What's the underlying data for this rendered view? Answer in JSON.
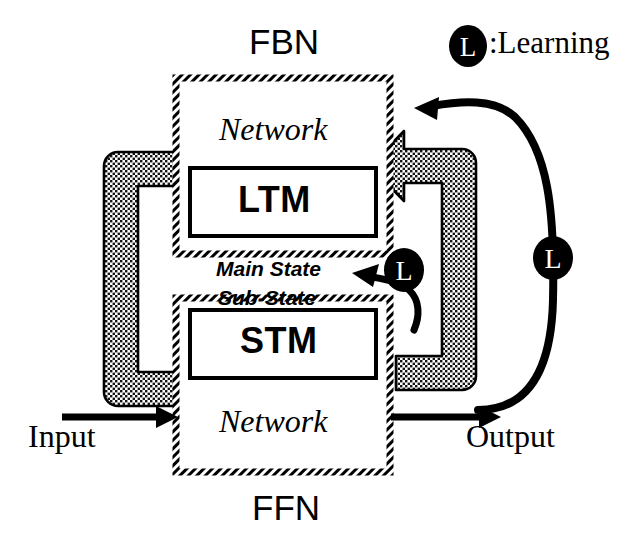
{
  "diagram": {
    "title_top": "FBN",
    "title_bottom": "FFN",
    "legend": {
      "badge": "L",
      "text": ":Learning",
      "badge_icon": "learning-badge-icon"
    },
    "fbn_block": {
      "network_label": "Network",
      "memory_label": "LTM"
    },
    "ffn_block": {
      "network_label": "Network",
      "memory_label": "STM"
    },
    "middle_labels": {
      "main_state": "Main State",
      "sub_state": "Sub-State"
    },
    "io": {
      "input_label": "Input",
      "output_label": "Output"
    },
    "inner_learning_badge": "L",
    "outer_learning_badge": "L",
    "colors": {
      "ink": "#000000",
      "paper": "#ffffff",
      "stipple_dot": "#1a1a1a",
      "stipple_field": "#ffffff"
    }
  }
}
